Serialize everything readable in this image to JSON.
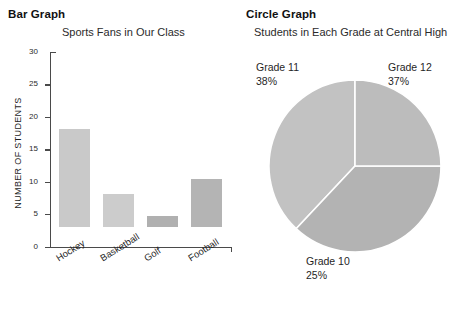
{
  "bar_panel": {
    "heading": "Bar Graph",
    "subtitle": "Sports Fans in Our Class"
  },
  "pie_panel": {
    "heading": "Circle Graph",
    "subtitle": "Students in Each Grade at Central High"
  },
  "chart_data": [
    {
      "type": "bar",
      "title": "Sports Fans in Our Class",
      "xlabel": "",
      "ylabel": "NUMBER OF STUDENTS",
      "ylim": [
        0,
        30
      ],
      "yticks": [
        0,
        5,
        10,
        15,
        20,
        25,
        30
      ],
      "ytick_labels": [
        "0",
        "5",
        "10",
        "15",
        "20",
        "25",
        "30"
      ],
      "grid": false,
      "legend": "none",
      "categories": [
        "Hockey",
        "Basketball",
        "Golf",
        "Football"
      ],
      "values": [
        15,
        5,
        1.7,
        7.4
      ],
      "bar_colors": [
        "#c9c9c9",
        "#cccccc",
        "#b0b0b0",
        "#b4b4b4"
      ]
    },
    {
      "type": "pie",
      "title": "Students in Each Grade at Central High",
      "legend": "none",
      "labels": [
        "Grade 11",
        "Grade 12",
        "Grade 10"
      ],
      "values": [
        38,
        37,
        25
      ],
      "percent_labels": [
        "38%",
        "37%",
        "25%"
      ],
      "slice_colors": [
        "#c2c2c2",
        "#b3b3b3",
        "#bcbcbc"
      ],
      "start_angle_deg": 270,
      "direction": "counterclockwise"
    }
  ],
  "colors": {
    "axis": "#4a4a4a",
    "text": "#1f1f1f",
    "background": "#ffffff"
  }
}
